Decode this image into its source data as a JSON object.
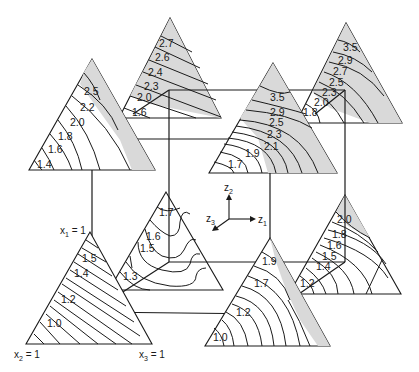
{
  "figure": {
    "axis_indicator": {
      "z1": "z",
      "z1_sub": "1",
      "z2": "z",
      "z2_sub": "2",
      "z3": "z",
      "z3_sub": "3"
    },
    "vertex_labels": {
      "x1": "x",
      "x1_sub": "1",
      "x1_val": " = 1",
      "x2": "x",
      "x2_sub": "2",
      "x2_val": " = 1",
      "x3": "x",
      "x3_sub": "3",
      "x3_val": " = 1"
    },
    "triangles": {
      "top_left_front": {
        "contours": [
          "2.5",
          "2.2",
          "2.0",
          "1.8",
          "1.6",
          "1.4"
        ]
      },
      "top_left_back": {
        "contours": [
          "2.7",
          "2.6",
          "2.4",
          "2.3",
          "2.0",
          "1.6"
        ]
      },
      "top_right_front": {
        "contours": [
          "3.5",
          "2.9",
          "2.5",
          "2.3",
          "2.1",
          "1.9",
          "1.7"
        ]
      },
      "top_right_back": {
        "contours": [
          "3.5",
          "2.9",
          "2.7",
          "2.5",
          "2.3",
          "2.0",
          "1.8"
        ]
      },
      "bottom_left_back": {
        "contours": [
          "1.7",
          "1.6",
          "1.5",
          "1.3"
        ]
      },
      "bottom_left_front": {
        "contours": [
          "1.5",
          "1.4",
          "1.2",
          "1.0"
        ]
      },
      "bottom_right_front": {
        "contours": [
          "1.9",
          "1.7",
          "1.2",
          "1.0"
        ]
      },
      "bottom_right_back": {
        "contours": [
          "2.0",
          "1.8",
          "1.6",
          "1.5",
          "1.4",
          "1.2"
        ]
      }
    }
  }
}
